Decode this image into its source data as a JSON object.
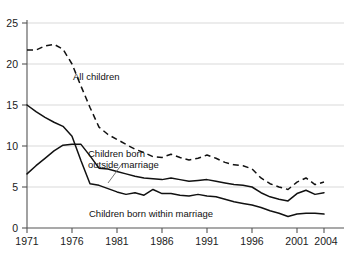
{
  "chart_data": {
    "type": "line",
    "title": "",
    "subtitle": "",
    "xlabel": "",
    "ylabel": "",
    "xlim": [
      1971,
      2004
    ],
    "ylim": [
      0,
      25
    ],
    "grid": true,
    "grid_axis": "y",
    "legend_position": "inline-annotations",
    "x": [
      1971,
      1972,
      1973,
      1974,
      1975,
      1976,
      1977,
      1978,
      1979,
      1980,
      1981,
      1982,
      1983,
      1984,
      1985,
      1986,
      1987,
      1988,
      1989,
      1990,
      1991,
      1992,
      1993,
      1994,
      1995,
      1996,
      1997,
      1998,
      1999,
      2000,
      2001,
      2002,
      2003,
      2004
    ],
    "x_tick_labels": [
      "1971",
      "1976",
      "1981",
      "1986",
      "1991",
      "1996",
      "2001",
      "2004"
    ],
    "x_ticks": [
      1971,
      1976,
      1981,
      1986,
      1991,
      1996,
      2001,
      2004
    ],
    "y_tick_labels": [
      "0",
      "5",
      "10",
      "15",
      "20",
      "25"
    ],
    "y_ticks": [
      0,
      5,
      10,
      15,
      20,
      25
    ],
    "series": [
      {
        "name": "All children",
        "style": "dashed",
        "color": "#111111",
        "label_x": 1976.4,
        "label_y": 16.6,
        "values": [
          21.7,
          21.7,
          22.2,
          22.4,
          21.8,
          20.0,
          17.3,
          14.7,
          12.3,
          11.4,
          10.8,
          10.2,
          9.6,
          9.2,
          8.7,
          8.6,
          9.0,
          8.6,
          8.3,
          8.5,
          8.9,
          8.5,
          8.0,
          7.7,
          7.6,
          7.2,
          6.1,
          5.4,
          5.0,
          4.7,
          5.6,
          6.1,
          5.3,
          5.6
        ]
      },
      {
        "name": "Children born outside marriage",
        "style": "solid",
        "color": "#111111",
        "label_x": 1977.0,
        "label_y": 9.1,
        "values": [
          6.6,
          7.6,
          8.5,
          9.4,
          10.1,
          10.2,
          10.2,
          8.8,
          7.3,
          7.2,
          6.9,
          6.6,
          6.3,
          6.1,
          6.0,
          5.9,
          6.1,
          5.9,
          5.7,
          5.8,
          5.9,
          5.7,
          5.5,
          5.3,
          5.2,
          5.0,
          4.3,
          3.8,
          3.5,
          3.3,
          4.2,
          4.6,
          4.1,
          4.3
        ]
      },
      {
        "name": "Children born within marriage",
        "style": "solid",
        "color": "#111111",
        "label_x": 1982.0,
        "label_y": 2.6,
        "values": [
          15.0,
          14.2,
          13.5,
          12.9,
          12.4,
          11.2,
          8.2,
          5.4,
          5.2,
          4.8,
          4.4,
          4.1,
          4.3,
          4.0,
          4.7,
          4.2,
          4.2,
          4.0,
          3.9,
          4.1,
          3.9,
          3.8,
          3.5,
          3.2,
          3.0,
          2.8,
          2.5,
          2.1,
          1.8,
          1.4,
          1.7,
          1.8,
          1.8,
          1.7
        ]
      }
    ],
    "annotations": [
      {
        "name": "all-children-label",
        "text": "All children"
      },
      {
        "name": "outside-marriage-label",
        "text": "Children born"
      },
      {
        "name": "outside-marriage-label-2",
        "text": "outside marriage"
      },
      {
        "name": "within-marriage-label",
        "text": "Children born within marriage"
      }
    ],
    "colors": {
      "line": "#111111",
      "grid": "#d9d9d9",
      "axis": "#555555",
      "text": "#1a1a1a",
      "background": "#ffffff"
    }
  },
  "labels": {
    "all_children": "All children",
    "outside_line1": "Children born",
    "outside_line2": "outside marriage",
    "within": "Children born within marriage"
  },
  "y_axis": {
    "t0": "0",
    "t1": "5",
    "t2": "10",
    "t3": "15",
    "t4": "20",
    "t5": "25"
  },
  "x_axis": {
    "t0": "1971",
    "t1": "1976",
    "t2": "1981",
    "t3": "1986",
    "t4": "1991",
    "t5": "1996",
    "t6": "2001",
    "t7": "2004"
  }
}
